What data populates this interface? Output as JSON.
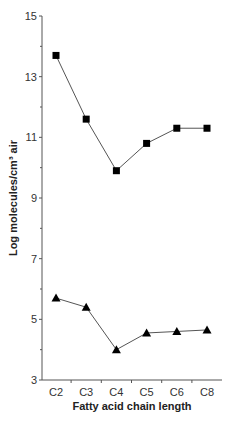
{
  "chart_data": {
    "type": "line",
    "title": "",
    "xlabel": "Fatty acid chain length",
    "ylabel": "Log molecules/cm³ air",
    "categories": [
      "C2",
      "C3",
      "C4",
      "C5",
      "C6",
      "C8"
    ],
    "ylim": [
      3,
      15
    ],
    "yticks": [
      3,
      5,
      7,
      9,
      11,
      13,
      15
    ],
    "grid": false,
    "legend": "none",
    "series": [
      {
        "name": "squares",
        "marker": "square",
        "color": "#000000",
        "values": [
          13.7,
          11.6,
          9.9,
          10.8,
          11.3,
          11.3
        ]
      },
      {
        "name": "triangles",
        "marker": "triangle",
        "color": "#000000",
        "values": [
          5.7,
          5.4,
          4.0,
          4.55,
          4.6,
          4.65
        ]
      }
    ]
  }
}
